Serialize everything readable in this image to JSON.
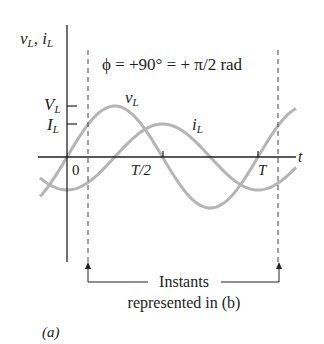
{
  "figure": {
    "y_axis_label": "v",
    "y_axis_label_sub": "L",
    "y_axis_label_sep": ", ",
    "y_axis_label2": "i",
    "y_axis_label2_sub": "L",
    "x_axis_label": "t",
    "phase_label": "ϕ = +90° = + π/2 rad",
    "ticks": {
      "origin": "0",
      "half": "T/2",
      "full": "T"
    },
    "amplitude_labels": {
      "voltage": "V",
      "voltage_sub": "L",
      "current": "I",
      "current_sub": "L"
    },
    "curve_labels": {
      "voltage": "v",
      "voltage_sub": "L",
      "current": "i",
      "current_sub": "L"
    },
    "annotation_line1": "Instants",
    "annotation_line2": "represented in (b)",
    "panel_label": "(a)",
    "colors": {
      "curves": "#b5b5b5",
      "axes": "#222222",
      "text": "#222222"
    }
  },
  "chart_data": {
    "type": "line",
    "title": "ϕ = +90° = + π/2 rad",
    "xlabel": "t",
    "ylabel": "v_L, i_L",
    "x_ticks": [
      "0",
      "T/2",
      "T"
    ],
    "y_ticks": [
      "V_L",
      "I_L"
    ],
    "series": [
      {
        "name": "v_L",
        "function": "V_L sin(ωt)",
        "amplitude": "V_L",
        "phase_lead_deg": 90
      },
      {
        "name": "i_L",
        "function": "I_L sin(ωt - π/2)",
        "amplitude": "I_L",
        "phase_lead_deg": 0
      }
    ],
    "annotations": [
      "Instants represented in (b)"
    ],
    "grid": false
  }
}
